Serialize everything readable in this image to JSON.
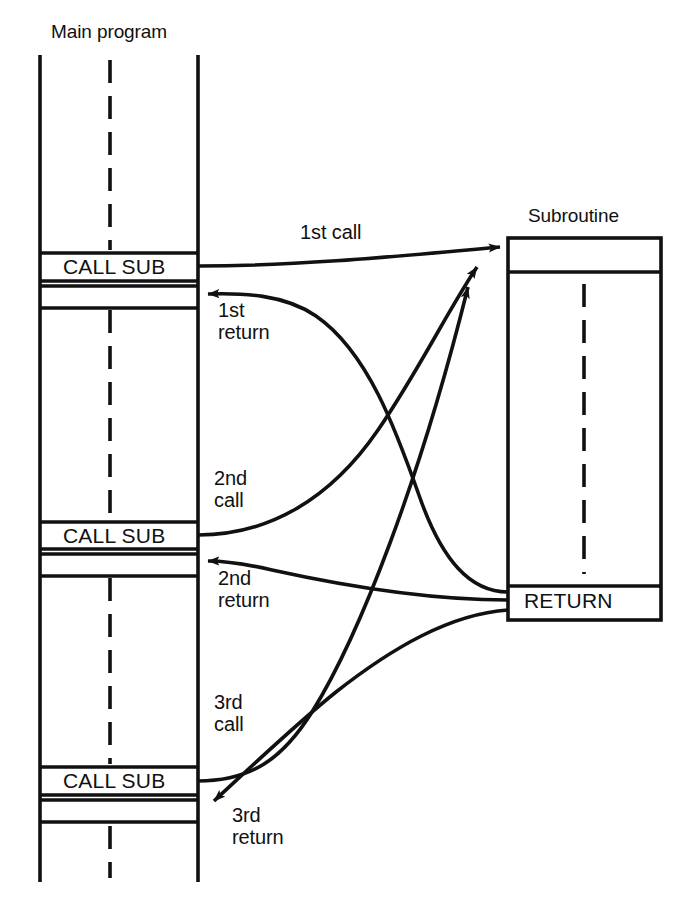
{
  "diagram": {
    "type": "subroutine-call-return-flow",
    "titles": {
      "main_program": "Main program",
      "subroutine": "Subroutine"
    },
    "main_program": {
      "call_boxes": [
        {
          "label": "CALL SUB"
        },
        {
          "label": "CALL SUB"
        },
        {
          "label": "CALL SUB"
        }
      ]
    },
    "subroutine": {
      "return_box": {
        "label": "RETURN"
      }
    },
    "edges": [
      {
        "id": "call-1",
        "label": "1st call",
        "kind": "call"
      },
      {
        "id": "return-1",
        "label_line1": "1st",
        "label_line2": "return",
        "kind": "return"
      },
      {
        "id": "call-2",
        "label_line1": "2nd",
        "label_line2": "call",
        "kind": "call"
      },
      {
        "id": "return-2",
        "label_line1": "2nd",
        "label_line2": "return",
        "kind": "return"
      },
      {
        "id": "call-3",
        "label_line1": "3rd",
        "label_line2": "call",
        "kind": "call"
      },
      {
        "id": "return-3",
        "label_line1": "3rd",
        "label_line2": "return",
        "kind": "return"
      }
    ],
    "colors": {
      "ink": "#111111",
      "background": "#ffffff"
    }
  }
}
